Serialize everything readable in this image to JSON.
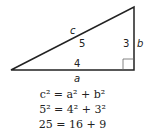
{
  "diagram": {
    "type": "right-triangle",
    "labels": {
      "hypotenuse_symbol": "c",
      "hypotenuse_value": "5",
      "vertical_value": "3",
      "vertical_symbol": "b",
      "base_value": "4",
      "base_symbol": "a"
    },
    "line_color": "#222222"
  },
  "equations": [
    "c² = a² + b²",
    "5² = 4² + 3²",
    "25 = 16 + 9"
  ]
}
